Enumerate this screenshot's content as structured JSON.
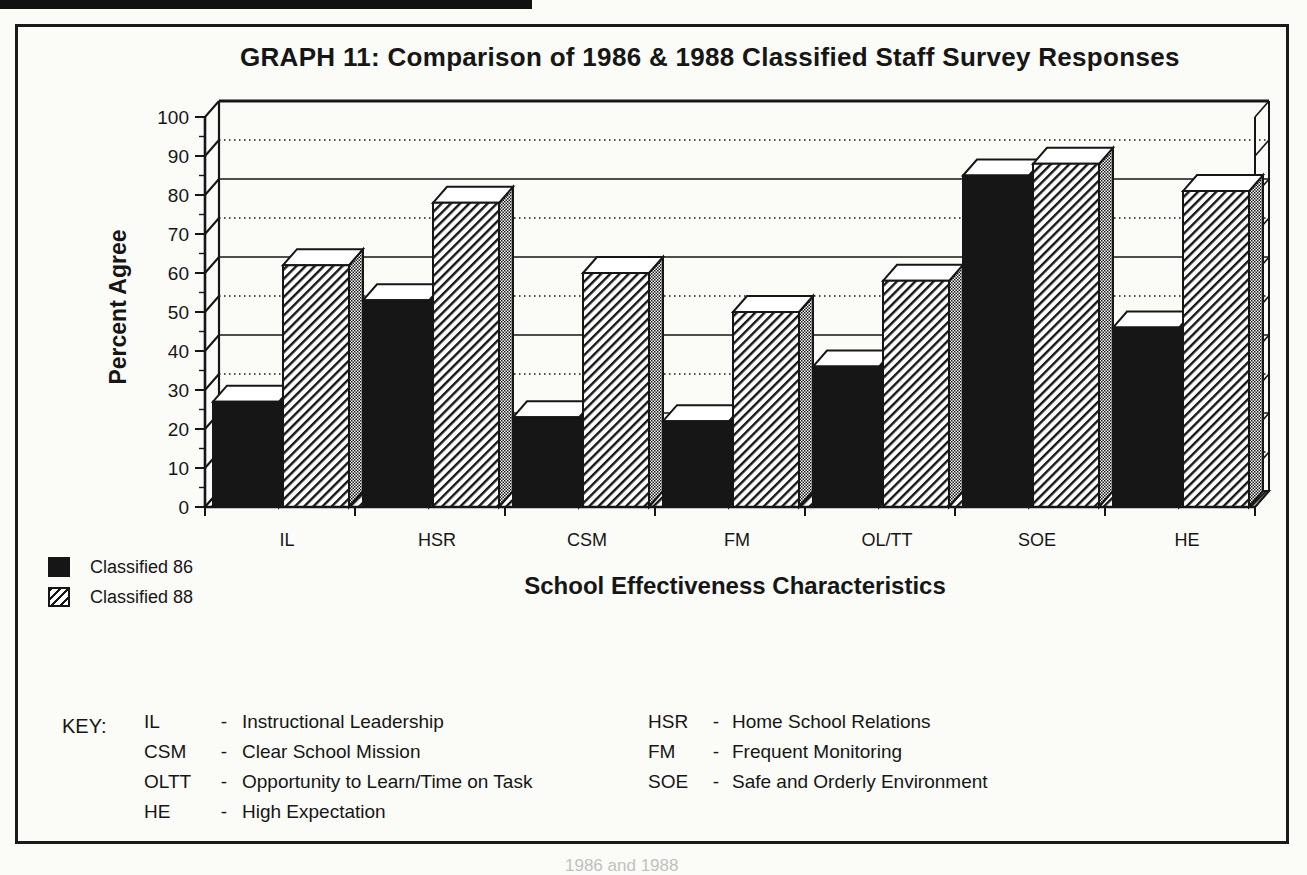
{
  "page": {
    "partial_caption": "1986 and 1988"
  },
  "chart_data": {
    "type": "bar",
    "style": "3d-perspective grouped bars, monochrome scanned print",
    "title": "GRAPH 11:  Comparison of 1986 & 1988 Classified Staff Survey Responses",
    "xlabel": "School Effectiveness Characteristics",
    "ylabel": "Percent Agree",
    "ylim": [
      0,
      100
    ],
    "y_ticks": [
      0,
      10,
      20,
      30,
      40,
      50,
      60,
      70,
      80,
      90,
      100
    ],
    "grid": "horizontal back-wall gridlines every 10, alternating dotted/solid",
    "legend_position": "bottom-left",
    "categories": [
      "IL",
      "HSR",
      "CSM",
      "FM",
      "OL/TT",
      "SOE",
      "HE"
    ],
    "series": [
      {
        "name": "Classified 86",
        "pattern": "solid-black",
        "values": [
          27,
          53,
          23,
          22,
          36,
          85,
          46
        ]
      },
      {
        "name": "Classified 88",
        "pattern": "diagonal-hatch",
        "values": [
          62,
          78,
          60,
          50,
          58,
          88,
          81
        ]
      }
    ]
  },
  "key": {
    "label": "KEY:",
    "separator": "-",
    "columns": [
      {
        "items": [
          {
            "abbr": "IL",
            "def": "Instructional Leadership"
          },
          {
            "abbr": "CSM",
            "def": "Clear School Mission"
          },
          {
            "abbr": "OLTT",
            "def": "Opportunity to Learn/Time on Task"
          },
          {
            "abbr": "HE",
            "def": "High Expectation"
          }
        ]
      },
      {
        "items": [
          {
            "abbr": "HSR",
            "def": "Home School Relations"
          },
          {
            "abbr": "FM",
            "def": "Frequent Monitoring"
          },
          {
            "abbr": "SOE",
            "def": "Safe and Orderly Environment"
          }
        ]
      }
    ]
  },
  "colors": {
    "ink": "#161616",
    "paper": "#fbfbf8"
  }
}
